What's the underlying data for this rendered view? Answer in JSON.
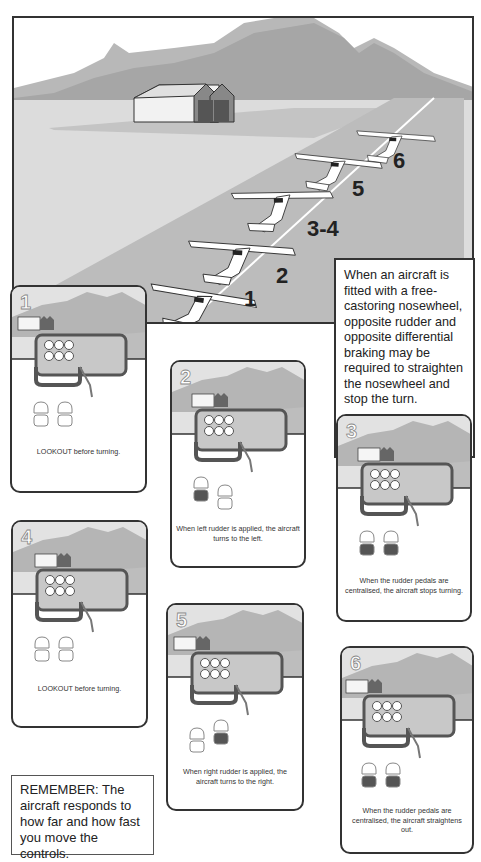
{
  "scene": {
    "step_labels": [
      {
        "id": "1",
        "text": "1",
        "x": 242,
        "y": 292
      },
      {
        "id": "2",
        "text": "2",
        "x": 274,
        "y": 258
      },
      {
        "id": "3-4",
        "text": "3-4",
        "x": 305,
        "y": 212
      },
      {
        "id": "5",
        "text": "5",
        "x": 350,
        "y": 172
      },
      {
        "id": "6",
        "text": "6",
        "x": 391,
        "y": 144
      }
    ],
    "colors": {
      "sky": "#ffffff",
      "mountain_far": "#b8b8b8",
      "mountain_near": "#a6a6a6",
      "ground": "#dcdcdc",
      "taxiway": "#bcbcbc",
      "centerline": "#ffffff",
      "hangar_door": "#555555"
    }
  },
  "info_box": {
    "text": "When an aircraft is fitted with a free-castoring nosewheel, opposite rudder and opposite differential braking may be required to straighten the nosewheel and stop the turn."
  },
  "cards": [
    {
      "number": "1",
      "caption": "LOOKOUT before turning.",
      "pedals": {
        "left_top": "up",
        "left_bottom": "up",
        "right_top": "up",
        "right_bottom": "up",
        "layout": "level"
      }
    },
    {
      "number": "2",
      "caption": "When left rudder is applied, the aircraft turns to the left.",
      "pedals": {
        "left_pressed": true,
        "right_pressed": false,
        "layout": "left-forward"
      }
    },
    {
      "number": "3",
      "caption": "When the rudder pedals are centralised, the aircraft stops turning.",
      "pedals": {
        "left_pressed": true,
        "right_pressed": true,
        "layout": "level"
      }
    },
    {
      "number": "4",
      "caption": "LOOKOUT before turning.",
      "pedals": {
        "left_pressed": false,
        "right_pressed": false,
        "layout": "level"
      }
    },
    {
      "number": "5",
      "caption": "When right rudder is applied, the aircraft turns to the right.",
      "pedals": {
        "left_pressed": false,
        "right_pressed": true,
        "layout": "right-forward"
      }
    },
    {
      "number": "6",
      "caption": "When the rudder pedals are centralised, the aircraft straightens out.",
      "pedals": {
        "left_pressed": true,
        "right_pressed": true,
        "layout": "level"
      }
    }
  ],
  "remember": {
    "text": "REMEMBER: The aircraft responds to how far and how fast you move the controls."
  },
  "colors": {
    "border": "#333333",
    "yoke": "#555555",
    "panel": "#c8c8c8",
    "pedal_pressed": "#555555",
    "pedal_up": "#ffffff"
  }
}
